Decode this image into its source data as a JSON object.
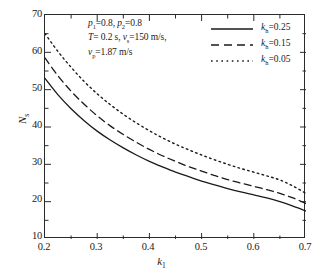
{
  "chart_data": {
    "type": "line",
    "title": "",
    "xlabel": "k1",
    "ylabel": "Ns",
    "xlim": [
      0.2,
      0.7
    ],
    "ylim": [
      10,
      70
    ],
    "xticks": [
      0.2,
      0.3,
      0.4,
      0.5,
      0.6,
      0.7
    ],
    "yticks": [
      10,
      20,
      30,
      40,
      50,
      60,
      70
    ],
    "xtick_labels": [
      "0.2",
      "0.3",
      "0.4",
      "0.5",
      "0.6",
      "0.7"
    ],
    "ytick_labels": [
      "10",
      "20",
      "30",
      "40",
      "50",
      "60",
      "70"
    ],
    "minor_ticks": true,
    "grid": false,
    "legend_position": "top-right",
    "x": [
      0.2,
      0.225,
      0.25,
      0.275,
      0.3,
      0.325,
      0.35,
      0.375,
      0.4,
      0.425,
      0.45,
      0.475,
      0.5,
      0.525,
      0.55,
      0.575,
      0.6,
      0.625,
      0.65,
      0.675,
      0.7
    ],
    "series": [
      {
        "name": "kh=0.25",
        "style": "solid",
        "values": [
          53.0,
          48.6,
          44.9,
          41.7,
          38.9,
          36.5,
          34.4,
          32.5,
          30.8,
          29.3,
          27.9,
          26.7,
          25.5,
          24.5,
          23.5,
          22.6,
          21.8,
          21.0,
          20.0,
          18.8,
          17.5
        ]
      },
      {
        "name": "kh=0.15",
        "style": "dashed",
        "values": [
          58.5,
          53.7,
          49.6,
          46.1,
          43.0,
          40.3,
          38.0,
          35.9,
          34.0,
          32.3,
          30.8,
          29.4,
          28.2,
          27.0,
          25.9,
          25.0,
          24.1,
          23.2,
          22.2,
          21.0,
          19.5
        ]
      },
      {
        "name": "kh=0.05",
        "style": "dotted",
        "values": [
          65.0,
          60.2,
          56.0,
          52.2,
          48.9,
          46.0,
          43.4,
          41.1,
          39.0,
          37.1,
          35.4,
          33.9,
          32.5,
          31.2,
          30.0,
          28.9,
          27.9,
          26.9,
          25.8,
          24.2,
          22.2
        ]
      }
    ],
    "annotations": [
      "p1=0.8, p2=0.8",
      "T= 0.2 s, vs=150 m/s,",
      "vp=1.87 m/s"
    ]
  },
  "axes": {
    "y_title_symbol": "N",
    "y_title_sub": "s",
    "x_title_symbol": "k",
    "x_title_sub": "1",
    "y_tick_labels": [
      "70",
      "60",
      "50",
      "40",
      "30",
      "20",
      "10"
    ],
    "x_tick_labels": [
      "0.2",
      "0.3",
      "0.4",
      "0.5",
      "0.6",
      "0.7"
    ]
  },
  "annotation": {
    "line1_p1_sym": "p",
    "line1_p1_sub": "1",
    "line1_p1_val": "=0.8, ",
    "line1_p2_sym": "p",
    "line1_p2_sub": "2",
    "line1_p2_val": "=0.8",
    "line2_T_sym": "T",
    "line2_T_val": "= 0.2 s, ",
    "line2_v_sym": "v",
    "line2_v_sub": "s",
    "line2_v_val": "=150 m/s,",
    "line3_v_sym": "v",
    "line3_v_sub": "p",
    "line3_v_val": "=1.87 m/s"
  },
  "legend": {
    "items": [
      {
        "symbol": "k",
        "sub": "h",
        "value": "=0.25",
        "style": "solid"
      },
      {
        "symbol": "k",
        "sub": "h",
        "value": "=0.15",
        "style": "dashed"
      },
      {
        "symbol": "k",
        "sub": "h",
        "value": "=0.05",
        "style": "dotted"
      }
    ]
  },
  "caption": {
    "text": ""
  },
  "colors": {
    "line": "#1a1a1a",
    "frame": "#2b2b2b",
    "background": "#ffffff"
  }
}
